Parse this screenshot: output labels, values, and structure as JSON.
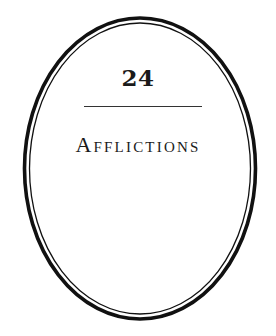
{
  "chapter": {
    "number": "24",
    "title": "Afflictions"
  },
  "frame": {
    "shape": "double-oval",
    "stroke_color": "#111111",
    "background": "#ffffff"
  }
}
